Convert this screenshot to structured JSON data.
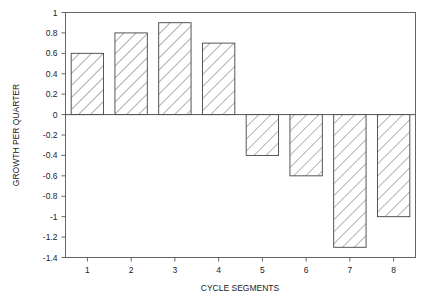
{
  "chart_data": {
    "type": "bar",
    "title": "",
    "xlabel": "CYCLE SEGMENTS",
    "ylabel": "GROWTH PER QUARTER",
    "categories": [
      "1",
      "2",
      "3",
      "4",
      "5",
      "6",
      "7",
      "8"
    ],
    "values": [
      0.6,
      0.8,
      0.9,
      0.7,
      -0.4,
      -0.6,
      -1.3,
      -1.0
    ],
    "ylim": [
      -1.4,
      1
    ],
    "yticks": [
      1,
      0.8,
      0.6,
      0.4,
      0.2,
      0,
      -0.2,
      -0.4,
      -0.6,
      -0.8,
      -1,
      -1.2,
      -1.4
    ],
    "ytick_labels": [
      "1",
      "0.8",
      "0.6",
      "0.4",
      "0.2",
      "0",
      "-0.2",
      "-0.4",
      "-0.6",
      "-0.8",
      "-1",
      "-1.2",
      "-1.4"
    ],
    "grid": false,
    "legend": null,
    "bar_fill": "diagonal-hatch",
    "colors": {
      "bar_outline": "#444444",
      "hatch": "#555555",
      "axis": "#666666",
      "zero_line": "#555555"
    }
  }
}
